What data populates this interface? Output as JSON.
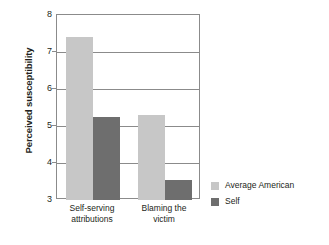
{
  "chart_data": {
    "type": "bar",
    "title": "",
    "subtitle": "",
    "xlabel": "",
    "ylabel": "Perceived susceptibility",
    "categories": [
      "Self-serving attributions",
      "Blaming the victim"
    ],
    "category_lines": [
      [
        "Self-serving",
        "attributions"
      ],
      [
        "Blaming the",
        "victim"
      ]
    ],
    "series": [
      {
        "name": "Average American",
        "values": [
          7.4,
          5.3
        ],
        "color": "#c7c7c7"
      },
      {
        "name": "Self",
        "values": [
          5.25,
          3.55
        ],
        "color": "#6e6e6e"
      }
    ],
    "ylim": [
      3,
      8
    ],
    "yticks": [
      8,
      7,
      6,
      5,
      4,
      3
    ],
    "ytick_labels": [
      "8",
      "7",
      "6",
      "5",
      "4",
      "3"
    ],
    "grid": true,
    "grid_axis": "y",
    "legend_position": "right",
    "frame_color": "#8b8b8b"
  }
}
